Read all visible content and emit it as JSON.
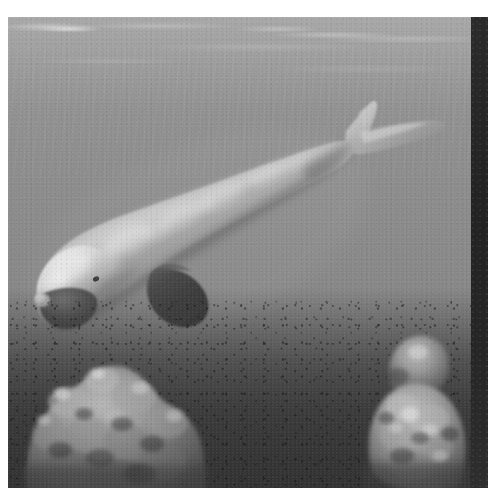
{
  "page": {
    "background_color": "#ffffff",
    "width": 488,
    "height": 503
  },
  "photo": {
    "kind": "photograph",
    "subject": "dugong",
    "scene": "underwater",
    "color_mode": "grayscale",
    "orientation": "landscape",
    "plate": {
      "left": 8,
      "top": 17,
      "width": 464,
      "height": 471
    },
    "palette": {
      "water_top": "#9c9c9c",
      "water_mid": "#8b8b8b",
      "water_deep": "#6e6e6e",
      "seafloor_dark": "#484848",
      "animal_light": "#cfcfcf",
      "animal_highlight": "#e8e8e8",
      "animal_shadow": "#5a5a5a",
      "flipper_dark": "#3a3a3a",
      "coral_light": "#b4b4b4",
      "coral_shadow": "#3d3d3d",
      "right_band": "#252525",
      "page_white": "#ffffff"
    },
    "regions": [
      {
        "name": "water-surface",
        "description": "rippled light water surface with bright streaks across the top of the frame"
      },
      {
        "name": "water-column",
        "description": "open mid-gray water filling the upper two thirds of the frame"
      },
      {
        "name": "dugong-body",
        "description": "large pale torpedo-shaped body angled from lower-left to upper-right"
      },
      {
        "name": "dugong-head",
        "description": "blunt rounded head with downturned dark snout at lower left"
      },
      {
        "name": "dugong-flipper",
        "description": "dark paddle-shaped pectoral flipper below the mid body"
      },
      {
        "name": "dugong-fluke",
        "description": "crescent whale-like tail fluke at the upper right"
      },
      {
        "name": "coral-left",
        "description": "large knobbly coral bommie on the lower left of the seabed"
      },
      {
        "name": "coral-right",
        "description": "smaller rounded coral head on the lower right of the seabed"
      },
      {
        "name": "seabed",
        "description": "dark speckled sand and rubble covering the bottom of the frame"
      }
    ],
    "right_band": {
      "left": 471,
      "top": 17,
      "width": 17,
      "height": 471,
      "color": "#252525",
      "description": "dark vertical strip along the right edge of the plate"
    }
  }
}
